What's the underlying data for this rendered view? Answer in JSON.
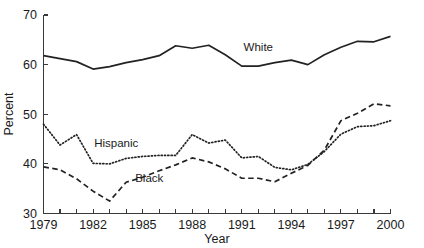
{
  "chart_data": {
    "type": "line",
    "title": "",
    "xlabel": "Year",
    "ylabel": "Percent",
    "xlim": [
      1979,
      2000
    ],
    "ylim": [
      30,
      70
    ],
    "yticks": [
      30,
      40,
      50,
      60,
      70
    ],
    "ytick_labels": [
      "30",
      "40",
      "50",
      "60",
      "70"
    ],
    "xticks": [
      1979,
      1980,
      1981,
      1982,
      1983,
      1984,
      1985,
      1986,
      1987,
      1988,
      1989,
      1990,
      1991,
      1992,
      1993,
      1994,
      1995,
      1996,
      1997,
      1998,
      1999,
      2000
    ],
    "xtick_labels": [
      "1979",
      "",
      "",
      "1982",
      "",
      "",
      "1985",
      "",
      "",
      "1988",
      "",
      "",
      "1991",
      "",
      "",
      "1994",
      "",
      "",
      "1997",
      "",
      "",
      "2000"
    ],
    "grid": false,
    "legend_position": "inline-annotation",
    "x": [
      1979,
      1980,
      1981,
      1982,
      1983,
      1984,
      1985,
      1986,
      1987,
      1988,
      1989,
      1990,
      1991,
      1992,
      1993,
      1994,
      1995,
      1996,
      1997,
      1998,
      1999,
      2000
    ],
    "series": [
      {
        "name": "White",
        "style": "solid",
        "color": "#222222",
        "label_x": 1992,
        "label_y": 62.7,
        "values": [
          61.8,
          61.2,
          60.6,
          59.1,
          59.6,
          60.4,
          61.0,
          61.8,
          63.8,
          63.3,
          63.9,
          62.0,
          59.7,
          59.7,
          60.4,
          60.9,
          60.0,
          62.0,
          63.5,
          64.7,
          64.6,
          65.7
        ]
      },
      {
        "name": "Hispanic",
        "style": "dotted",
        "color": "#222222",
        "label_x": 1983.4,
        "label_y": 43.4,
        "values": [
          48.0,
          43.8,
          45.9,
          40.1,
          40.0,
          41.1,
          41.5,
          41.7,
          41.7,
          45.9,
          44.2,
          44.8,
          41.2,
          41.5,
          39.3,
          38.8,
          39.9,
          42.5,
          46.0,
          47.5,
          47.7,
          48.7
        ]
      },
      {
        "name": "Black",
        "style": "dashed",
        "color": "#222222",
        "label_x": 1985.4,
        "label_y": 36.4,
        "values": [
          39.4,
          38.8,
          37.0,
          34.5,
          32.5,
          36.3,
          37.3,
          38.6,
          39.8,
          41.2,
          40.4,
          39.0,
          37.1,
          37.1,
          36.4,
          38.1,
          39.7,
          42.8,
          48.7,
          50.2,
          52.1,
          51.7
        ]
      }
    ]
  }
}
